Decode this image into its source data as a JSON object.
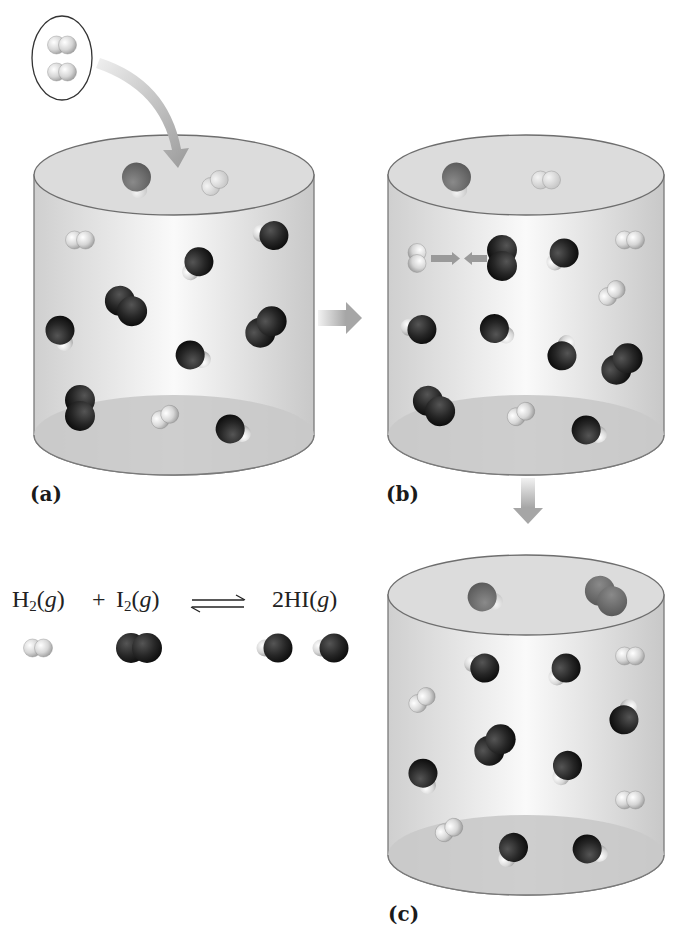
{
  "figure": {
    "panels": [
      {
        "id": "a",
        "label": "(a)"
      },
      {
        "id": "b",
        "label": "(b)"
      },
      {
        "id": "c",
        "label": "(c)"
      }
    ],
    "equation": {
      "reactant1": {
        "species": "H",
        "subscript": "2",
        "state": "g"
      },
      "plus": "+",
      "reactant2": {
        "species": "I",
        "subscript": "2",
        "state": "g"
      },
      "arrow": "equilibrium-arrows",
      "product": {
        "coefficient": "2",
        "species": "HI",
        "state": "g"
      }
    },
    "colors": {
      "hydrogen": "#e8e8e8",
      "iodine": "#202020",
      "cylinder_wall": "#d4d4d4",
      "cylinder_outline": "#777777",
      "arrow": "#a8a8a8"
    },
    "legend_molecules": [
      {
        "type": "H2",
        "x": 38,
        "y": 648
      },
      {
        "type": "I2",
        "x": 139,
        "y": 648
      },
      {
        "type": "HI",
        "x": 275,
        "y": 648
      },
      {
        "type": "HI",
        "x": 331,
        "y": 648
      }
    ],
    "added_molecules": [
      {
        "type": "H2v",
        "x": 62,
        "y": 45
      },
      {
        "type": "H2v",
        "x": 62,
        "y": 72
      }
    ],
    "cylinders": [
      {
        "id": "a",
        "cx": 174,
        "top": 175,
        "bottom": 435,
        "rx": 140,
        "ry": 40,
        "molecules": [
          {
            "type": "HI",
            "x": 137,
            "y": 180,
            "angle": -100,
            "faded": true
          },
          {
            "type": "H2",
            "x": 215,
            "y": 183,
            "angle": -40,
            "faded": true
          },
          {
            "type": "H2",
            "x": 80,
            "y": 240,
            "angle": 0
          },
          {
            "type": "HI",
            "x": 271,
            "y": 235,
            "angle": 10
          },
          {
            "type": "HI",
            "x": 197,
            "y": 264,
            "angle": -50
          },
          {
            "type": "I2",
            "x": 126,
            "y": 306,
            "angle": 40
          },
          {
            "type": "I2",
            "x": 266,
            "y": 327,
            "angle": -45
          },
          {
            "type": "HI",
            "x": 61,
            "y": 333,
            "angle": -110
          },
          {
            "type": "HI",
            "x": 193,
            "y": 356,
            "angle": 200
          },
          {
            "type": "I2",
            "x": 80,
            "y": 408,
            "angle": 90
          },
          {
            "type": "H2",
            "x": 165,
            "y": 417,
            "angle": -30
          },
          {
            "type": "HI",
            "x": 233,
            "y": 430,
            "angle": 200
          }
        ]
      },
      {
        "id": "b",
        "cx": 526,
        "top": 175,
        "bottom": 435,
        "rx": 138,
        "ry": 40,
        "molecules": [
          {
            "type": "HI",
            "x": 457,
            "y": 180,
            "angle": -100,
            "faded": true
          },
          {
            "type": "H2",
            "x": 546,
            "y": 180,
            "angle": 0,
            "faded": true
          },
          {
            "type": "H2v",
            "x": 417,
            "y": 258,
            "angle": 0
          },
          {
            "type": "I2v",
            "x": 502,
            "y": 258,
            "angle": 0
          },
          {
            "type": "HI",
            "x": 562,
            "y": 255,
            "angle": -45
          },
          {
            "type": "H2",
            "x": 630,
            "y": 240,
            "angle": 0
          },
          {
            "type": "H2",
            "x": 612,
            "y": 293,
            "angle": -40
          },
          {
            "type": "HI",
            "x": 419,
            "y": 329,
            "angle": 10
          },
          {
            "type": "HI",
            "x": 497,
            "y": 330,
            "angle": 210
          },
          {
            "type": "HI",
            "x": 563,
            "y": 353,
            "angle": 110
          },
          {
            "type": "I2",
            "x": 622,
            "y": 364,
            "angle": -45
          },
          {
            "type": "I2",
            "x": 434,
            "y": 406,
            "angle": 40
          },
          {
            "type": "H2",
            "x": 521,
            "y": 414,
            "angle": -30
          },
          {
            "type": "HI",
            "x": 589,
            "y": 431,
            "angle": 200
          }
        ]
      },
      {
        "id": "c",
        "cx": 526,
        "top": 595,
        "bottom": 855,
        "rx": 138,
        "ry": 40,
        "molecules": [
          {
            "type": "HI",
            "x": 485,
            "y": 598,
            "angle": 200,
            "faded": true
          },
          {
            "type": "I2",
            "x": 606,
            "y": 596,
            "angle": 40,
            "faded": true
          },
          {
            "type": "HI",
            "x": 482,
            "y": 667,
            "angle": 20
          },
          {
            "type": "HI",
            "x": 564,
            "y": 670,
            "angle": -45
          },
          {
            "type": "H2",
            "x": 630,
            "y": 656,
            "angle": 0
          },
          {
            "type": "H2",
            "x": 422,
            "y": 700,
            "angle": -40
          },
          {
            "type": "HI",
            "x": 625,
            "y": 717,
            "angle": 110
          },
          {
            "type": "I2",
            "x": 495,
            "y": 745,
            "angle": -45
          },
          {
            "type": "HI",
            "x": 424,
            "y": 776,
            "angle": -110
          },
          {
            "type": "HI",
            "x": 566,
            "y": 768,
            "angle": -60
          },
          {
            "type": "H2",
            "x": 630,
            "y": 800,
            "angle": 0
          },
          {
            "type": "H2",
            "x": 449,
            "y": 830,
            "angle": -30
          },
          {
            "type": "HI",
            "x": 512,
            "y": 850,
            "angle": -60
          },
          {
            "type": "HI",
            "x": 590,
            "y": 850,
            "angle": 200
          }
        ]
      }
    ]
  }
}
